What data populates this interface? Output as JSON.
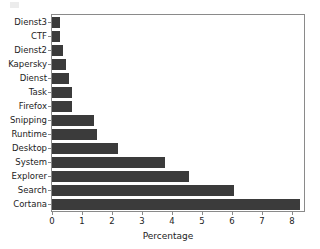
{
  "chart_data": {
    "type": "bar",
    "orientation": "horizontal",
    "title": "",
    "subtitle": "",
    "xlabel": "Percentage",
    "ylabel": "",
    "categories": [
      "Dienst3",
      "CTF",
      "Dienst2",
      "Kapersky",
      "Dienst",
      "Task",
      "Firefox",
      "Snipping",
      "Runtime",
      "Desktop",
      "System",
      "Explorer",
      "Search",
      "Cortana"
    ],
    "values": [
      0.28,
      0.28,
      0.38,
      0.48,
      0.58,
      0.68,
      0.68,
      1.4,
      1.5,
      2.2,
      3.75,
      4.55,
      6.05,
      8.25
    ],
    "xlim": [
      0,
      8.4
    ],
    "xticks": [
      0,
      1,
      2,
      3,
      4,
      5,
      6,
      7,
      8
    ],
    "xticklabels": [
      "0",
      "1",
      "2",
      "3",
      "4",
      "5",
      "6",
      "7",
      "8"
    ],
    "grid": false,
    "legend": null,
    "bar_color": "#3b3b3b",
    "background_color": "#ffffff",
    "axis_color": "#8a8a8a"
  },
  "figure": {
    "axis_title_x": "Percentage"
  }
}
